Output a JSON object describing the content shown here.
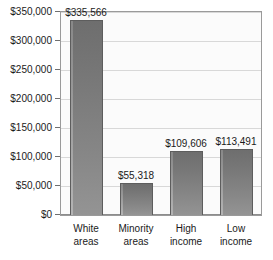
{
  "chart_data": {
    "type": "bar",
    "title": "",
    "subtitle": "",
    "xlabel": "",
    "ylabel": "",
    "categories": [
      "White areas",
      "Minority areas",
      "High income",
      "Low income"
    ],
    "category_lines": [
      [
        "White",
        "areas"
      ],
      [
        "Minority",
        "areas"
      ],
      [
        "High",
        "income"
      ],
      [
        "Low",
        "income"
      ]
    ],
    "values": [
      335566,
      55318,
      109606,
      113491
    ],
    "value_labels": [
      "$335,566",
      "$55,318",
      "$109,606",
      "$113,491"
    ],
    "ylim": [
      0,
      350000
    ],
    "ytick_values": [
      0,
      50000,
      100000,
      150000,
      200000,
      250000,
      300000,
      350000
    ],
    "ytick_labels": [
      "$0",
      "$50,000",
      "$100,000",
      "$150,000",
      "$200,000",
      "$250,000",
      "$300,000",
      "$350,000"
    ],
    "grid": true,
    "grid_axis": "y",
    "legend": false,
    "legend_position": "none",
    "bar_color": "#7d7d7d",
    "bar_edge_color": "#5d5d5d",
    "grid_color": "#d8d8d8",
    "axis_color": "#9a9a9a",
    "plot_background": "#fbfbfb",
    "figure_background": "#ffffff",
    "text_color": "#1a1a1a"
  }
}
